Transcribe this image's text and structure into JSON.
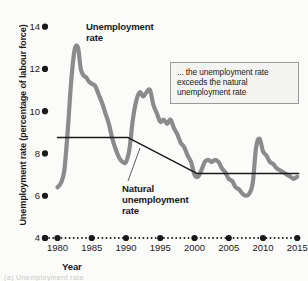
{
  "figure": {
    "ylabel": "Unemployment rate (percentage of labour force)",
    "xlabel": "Year",
    "callout_text": "... the unemployment rate exceeds the natural unemployment rate",
    "label_unemployment_line1": "Unemployment",
    "label_unemployment_line2": "rate",
    "label_natural_line1": "Natural",
    "label_natural_line2": "unemployment",
    "label_natural_line3": "rate",
    "bottom_caption": "(a) Unemployment rate"
  },
  "colors": {
    "unemployment_series": "#8b8b8b",
    "natural_series": "#1a1a1a",
    "axis": "#1a1a1a",
    "callout_border": "#9a9a9a",
    "callout_fill": "#f4f4f2",
    "background": "#fbfbfa"
  },
  "chart_data": {
    "type": "line",
    "title": "",
    "xlabel": "Year",
    "ylabel": "Unemployment rate (percentage of labour force)",
    "xlim": [
      1979.2,
      2015.4
    ],
    "ylim": [
      4,
      14.6
    ],
    "yticks": [
      4,
      6,
      8,
      10,
      12,
      14
    ],
    "xticks": [
      1980,
      1985,
      1990,
      1995,
      2000,
      2005,
      2010,
      2015
    ],
    "grid": false,
    "legend": "inline-labels",
    "series": [
      {
        "name": "Unemployment rate",
        "color": "#8b8b8b",
        "x": [
          1980.0,
          1980.5,
          1981.0,
          1981.5,
          1982.0,
          1982.5,
          1983.0,
          1983.4,
          1983.8,
          1984.2,
          1984.6,
          1985.0,
          1985.5,
          1986.0,
          1986.5,
          1987.0,
          1987.5,
          1988.0,
          1988.5,
          1989.0,
          1989.5,
          1990.0,
          1990.5,
          1991.0,
          1991.5,
          1992.0,
          1992.5,
          1993.0,
          1993.5,
          1994.0,
          1994.5,
          1995.0,
          1995.5,
          1996.0,
          1996.5,
          1997.0,
          1997.5,
          1998.0,
          1998.5,
          1999.0,
          1999.5,
          2000.0,
          2000.5,
          2001.0,
          2001.5,
          2002.0,
          2002.5,
          2003.0,
          2003.5,
          2004.0,
          2004.5,
          2005.0,
          2005.5,
          2006.0,
          2006.5,
          2007.0,
          2007.5,
          2008.0,
          2008.5,
          2009.0,
          2009.5,
          2010.0,
          2010.5,
          2011.0,
          2011.5,
          2012.0,
          2012.5,
          2013.0,
          2013.5,
          2014.0,
          2014.5,
          2015.0
        ],
        "y": [
          6.4,
          6.6,
          7.2,
          9.1,
          11.4,
          12.9,
          13.0,
          12.0,
          11.7,
          11.6,
          11.4,
          11.3,
          11.2,
          10.8,
          10.4,
          9.9,
          9.4,
          8.7,
          8.2,
          7.8,
          7.6,
          7.6,
          8.2,
          9.6,
          10.5,
          10.9,
          10.7,
          10.9,
          11.0,
          10.3,
          9.9,
          9.5,
          9.6,
          9.4,
          9.6,
          9.2,
          8.9,
          8.5,
          8.3,
          7.9,
          7.6,
          7.0,
          6.9,
          7.2,
          7.6,
          7.7,
          7.6,
          7.7,
          7.6,
          7.3,
          7.1,
          6.8,
          6.7,
          6.4,
          6.3,
          6.1,
          6.0,
          6.1,
          6.6,
          8.3,
          8.7,
          8.1,
          7.9,
          7.6,
          7.5,
          7.3,
          7.2,
          7.1,
          7.0,
          6.9,
          6.8,
          6.9
        ]
      },
      {
        "name": "Natural unemployment rate",
        "color": "#1a1a1a",
        "x": [
          1980.0,
          1990.3,
          2000.4,
          2015.2
        ],
        "y": [
          8.75,
          8.75,
          7.05,
          7.05
        ]
      }
    ],
    "annotations": [
      {
        "name": "callout",
        "text": "... the unemployment rate exceeds the natural unemployment rate"
      }
    ]
  }
}
